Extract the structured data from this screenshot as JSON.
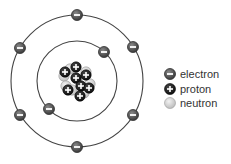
{
  "diagram": {
    "type": "bohr-atom-model",
    "colors": {
      "orbit": "#444444",
      "electron_fill": "#5a5a5a",
      "electron_stroke": "#333333",
      "proton_fill": "#1e1e1e",
      "neutron_fill": "#d6d6d6",
      "neutron_stroke": "#a0a0a0",
      "symbol": "#ffffff"
    },
    "center": {
      "x": 77,
      "y": 81
    },
    "orbits": [
      {
        "name": "inner-shell",
        "radius": 40,
        "electron_count": 2
      },
      {
        "name": "outer-shell",
        "radius": 66,
        "electron_count": 6
      }
    ],
    "electrons": [
      {
        "shell": "inner",
        "x": 104,
        "y": 52
      },
      {
        "shell": "inner",
        "x": 49,
        "y": 109
      },
      {
        "shell": "outer",
        "x": 77,
        "y": 15
      },
      {
        "shell": "outer",
        "x": 133,
        "y": 47
      },
      {
        "shell": "outer",
        "x": 133,
        "y": 115
      },
      {
        "shell": "outer",
        "x": 77,
        "y": 147
      },
      {
        "shell": "outer",
        "x": 20,
        "y": 115
      },
      {
        "shell": "outer",
        "x": 20,
        "y": 48
      }
    ],
    "nucleus": {
      "proton_count": 8,
      "neutron_count": 8
    }
  },
  "legend": {
    "items": [
      {
        "key": "electron",
        "label": "electron",
        "symbol": "−"
      },
      {
        "key": "proton",
        "label": "proton",
        "symbol": "+"
      },
      {
        "key": "neutron",
        "label": "neutron",
        "symbol": ""
      }
    ]
  }
}
